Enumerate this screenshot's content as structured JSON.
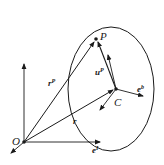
{
  "diagram": {
    "labels": {
      "origin": "O",
      "point": "P",
      "center": "C",
      "rp_main": "r",
      "rp_sup": "P",
      "r": "r",
      "up_main": "u",
      "up_sup": "P",
      "eb_main": "e",
      "eb_sup": "b",
      "e_frame_main": "e",
      "e_frame_sup": "I"
    },
    "colors": {
      "stroke": "#1a1a1a",
      "background": "#ffffff"
    }
  }
}
